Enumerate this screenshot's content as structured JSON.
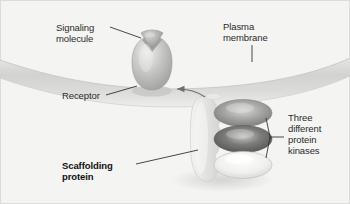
{
  "figure": {
    "type": "biology-diagram",
    "width": 350,
    "height": 204,
    "background_color": "#f4f4f2",
    "border_color": "#d5d5d2"
  },
  "labels": {
    "signaling_molecule": "Signaling\nmolecule",
    "plasma_membrane": "Plasma\nmembrane",
    "receptor": "Receptor",
    "protein_kinases": "Three\ndifferent\nprotein\nkinases",
    "scaffolding_protein": "Scaffolding\nprotein"
  },
  "structures": {
    "plasma_membrane": {
      "name": "plasma-membrane",
      "color": "#d6d6d4",
      "edge_color": "#c2c2c0"
    },
    "receptor": {
      "name": "receptor",
      "color": "#b9b9b7",
      "highlight": "#e8e8e6"
    },
    "signaling_molecule": {
      "name": "signaling-molecule",
      "color": "#9f9f9d",
      "highlight": "#cfcfcd"
    },
    "scaffolding_protein": {
      "name": "scaffolding-protein",
      "color": "#e4e4e2",
      "edge_color": "#cccccb"
    },
    "kinases": [
      {
        "name": "protein-kinase-top",
        "fill": "#9a9a98",
        "highlight": "#d2d2d0"
      },
      {
        "name": "protein-kinase-middle",
        "fill": "#6f6f6d",
        "highlight": "#c6c6c4"
      },
      {
        "name": "protein-kinase-bottom",
        "fill": "#ececea",
        "highlight": "#fbfbfa"
      }
    ],
    "arrow": {
      "name": "association-arrow",
      "color": "#7a7a78",
      "direction": "complex-to-receptor"
    }
  },
  "leader_lines": {
    "color": "#333333"
  }
}
